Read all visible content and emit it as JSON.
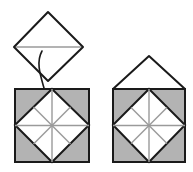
{
  "figure": {
    "background_color": "#ffffff",
    "ink_color": "#1a1a1a",
    "paper_white": "#ffffff",
    "paper_gray": "#b3b3b3",
    "crease_color": "#9a9a9a",
    "panels": [
      {
        "id": "panel-diamond",
        "name": "loose-diamond-flap",
        "shape": "diamond",
        "fill": "#ffffff",
        "stroke": "#1a1a1a",
        "stroke_width": 2,
        "points": "48,12 83,47 48,81 14,47",
        "crease_line": {
          "x1": 16,
          "y1": 47,
          "x2": 81,
          "y2": 47,
          "color": "#9a9a9a"
        }
      },
      {
        "id": "panel-left-base",
        "name": "left-square-base",
        "shape": "square-with-inscribed-diamond",
        "square": {
          "x": 15,
          "y": 89,
          "width": 74,
          "height": 73
        },
        "fill": "#b3b3b3",
        "stroke": "#1a1a1a",
        "stroke_width": 2,
        "inner_diamond_points": "52,89 89,125 52,162 15,125",
        "inner_fill": "#ffffff",
        "center": {
          "x": 52,
          "y": 125
        },
        "spoke_color": "#9a9a9a",
        "triangle_count": 8
      },
      {
        "id": "panel-right-result",
        "name": "right-house-result",
        "shape": "house",
        "square": {
          "x": 113,
          "y": 89,
          "width": 72,
          "height": 73
        },
        "fill": "#b3b3b3",
        "stroke": "#1a1a1a",
        "stroke_width": 2,
        "roof_points": "113,89 149,56 185,89",
        "roof_fill": "#ffffff",
        "inner_diamond_points": "149,89 185,125 149,162 113,125",
        "inner_fill": "#ffffff",
        "center": {
          "x": 149,
          "y": 125
        },
        "spoke_color": "#9a9a9a",
        "triangle_count": 8
      }
    ],
    "annotations": [
      {
        "id": "fold-arrow-curve",
        "name": "fold-guide-curve",
        "type": "curved-line",
        "style": "solid",
        "color": "#1a1a1a",
        "path": "M 42 51 C 36 62, 40 74, 44 88"
      },
      {
        "id": "fold-arrow-dashed",
        "name": "fold-direction-arrow",
        "type": "dashed-arrow",
        "style": "dashed",
        "color": "#1a1a1a",
        "from": {
          "x": 48,
          "y": 92
        },
        "to": {
          "x": 48,
          "y": 112
        },
        "arrowhead": "filled-triangle-down"
      }
    ]
  }
}
